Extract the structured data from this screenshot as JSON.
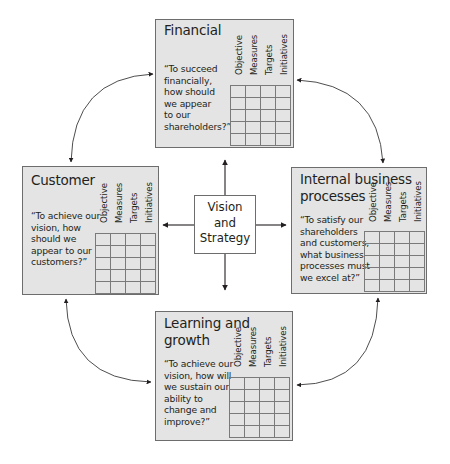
{
  "diagram": {
    "center": {
      "lines": [
        "Vision",
        "and",
        "Strategy"
      ]
    },
    "table_headers": [
      "Objective",
      "Measures",
      "Targets",
      "Initiatives"
    ],
    "table_rows": 5,
    "perspectives": [
      {
        "id": "financial",
        "title_lines": [
          "Financial"
        ],
        "question_lines": [
          "“To succeed",
          "financially,",
          "how should",
          "we appear",
          "to our",
          "shareholders?”"
        ]
      },
      {
        "id": "customer",
        "title_lines": [
          "Customer"
        ],
        "question_lines": [
          "“To achieve our",
          "vision, how",
          "should we",
          "appear to our",
          "customers?”"
        ]
      },
      {
        "id": "internal",
        "title_lines": [
          "Internal business",
          "processes"
        ],
        "question_lines": [
          "“To satisfy our",
          "shareholders",
          "and customers,",
          "what business",
          "processes must",
          "we excel at?”"
        ]
      },
      {
        "id": "learning",
        "title_lines": [
          "Learning and",
          "growth"
        ],
        "question_lines": [
          "“To achieve our",
          "vision, how will",
          "we sustain our",
          "ability to",
          "change and",
          "improve?”"
        ]
      }
    ],
    "colors": {
      "box_fill": "#e4e4e4",
      "box_border": "#6d6d6d",
      "grid_line": "#7a7a7a",
      "arrow": "#231f20",
      "center_fill": "#ffffff"
    }
  }
}
